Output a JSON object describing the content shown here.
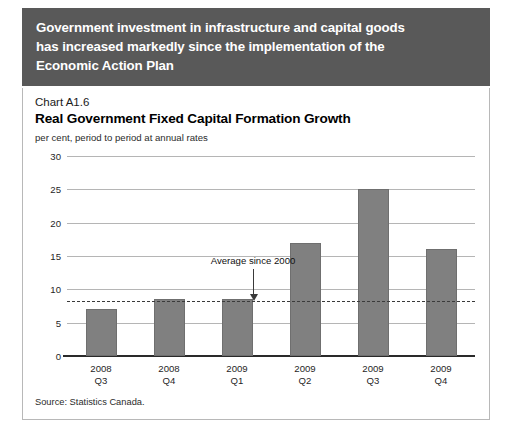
{
  "banner": {
    "lines": [
      "Government investment in infrastructure and capital goods",
      "has increased markedly since the implementation of the",
      "Economic Action Plan"
    ],
    "background": "#595959",
    "text_color": "#ffffff"
  },
  "panel": {
    "chart_number": "Chart A1.6",
    "source": "Source: Statistics Canada."
  },
  "chart_data": {
    "type": "bar",
    "title": "Real Government Fixed Capital Formation Growth",
    "subtitle": "per cent, period to period at annual rates",
    "xlabel": "",
    "ylabel": "",
    "categories": [
      "2008 Q3",
      "2008 Q4",
      "2009 Q1",
      "2009 Q2",
      "2009 Q3",
      "2009 Q4"
    ],
    "category_lines": [
      [
        "2008",
        "Q3"
      ],
      [
        "2008",
        "Q4"
      ],
      [
        "2009",
        "Q1"
      ],
      [
        "2009",
        "Q2"
      ],
      [
        "2009",
        "Q3"
      ],
      [
        "2009",
        "Q4"
      ]
    ],
    "values": [
      7.0,
      8.5,
      8.5,
      17.0,
      25.0,
      16.0
    ],
    "ylim": [
      0,
      30
    ],
    "yticks": [
      0,
      5,
      10,
      15,
      20,
      25,
      30
    ],
    "ytick_labels": [
      "0",
      "5",
      "10",
      "15",
      "20",
      "25",
      "30"
    ],
    "grid": true,
    "legend": "none",
    "bar_color": "#808080",
    "annotations": [
      {
        "label": "Average since 2000",
        "value": 8.3,
        "style": "dashed-line-with-arrow",
        "line_color": "#3a3a3a"
      }
    ]
  }
}
